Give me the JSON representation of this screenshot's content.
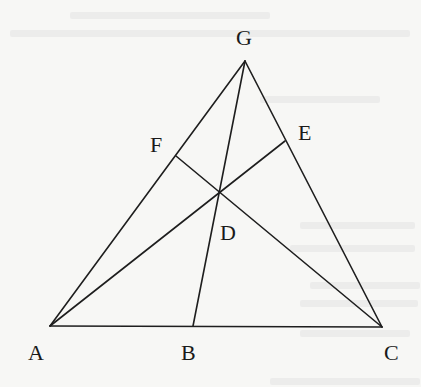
{
  "diagram": {
    "type": "geometry-triangle-cevians",
    "line_color": "#1e1e1e",
    "background": "#f7f7f5",
    "points": {
      "A": {
        "x": 50,
        "y": 326
      },
      "B": {
        "x": 193,
        "y": 326
      },
      "C": {
        "x": 382,
        "y": 327
      },
      "G": {
        "x": 245,
        "y": 61
      },
      "F": {
        "x": 176,
        "y": 156
      },
      "E": {
        "x": 285,
        "y": 141
      },
      "D": {
        "x": 219,
        "y": 192
      }
    },
    "labels": {
      "G": "G",
      "F": "F",
      "E": "E",
      "D": "D",
      "A": "A",
      "B": "B",
      "C": "C"
    },
    "segments": [
      "AG",
      "GC",
      "AC",
      "GB",
      "AE",
      "CF"
    ]
  }
}
